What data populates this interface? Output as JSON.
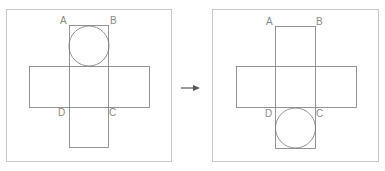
{
  "diagram": {
    "arrow": {
      "direction": "right",
      "color": "#555555"
    },
    "colors": {
      "frame": "#c8c8c8",
      "lines": "#7a7a7a",
      "labels": "#8a8a8a"
    },
    "panels": [
      {
        "name": "before",
        "labels": {
          "A": "A",
          "B": "B",
          "C": "C",
          "D": "D"
        },
        "circle_position": "top-face"
      },
      {
        "name": "after",
        "labels": {
          "A": "A",
          "B": "B",
          "C": "C",
          "D": "D"
        },
        "circle_position": "bottom-face"
      }
    ]
  }
}
